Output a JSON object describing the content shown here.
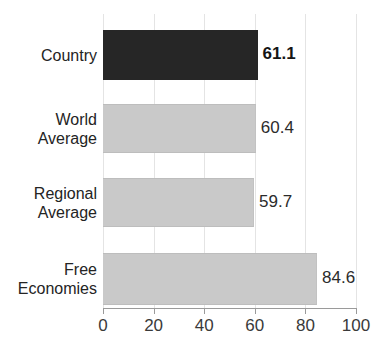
{
  "chart_data": {
    "type": "bar",
    "orientation": "horizontal",
    "title": "Country vs. Comparators",
    "title_visible": false,
    "categories": [
      "Country",
      "World Average",
      "Regional Average",
      "Free Economies"
    ],
    "category_label_lines": [
      [
        "Country"
      ],
      [
        "World",
        "Average"
      ],
      [
        "Regional",
        "Average"
      ],
      [
        "Free",
        "Economies"
      ]
    ],
    "values": [
      61.1,
      60.4,
      59.7,
      84.6
    ],
    "value_labels": [
      "61.1",
      "60.4",
      "59.7",
      "84.6"
    ],
    "bar_styles": [
      "dark",
      "light",
      "light",
      "light"
    ],
    "value_label_emphasis": [
      true,
      false,
      false,
      false
    ],
    "xlabel": "",
    "ylabel": "",
    "xlim": [
      0,
      100
    ],
    "xticks": [
      0,
      20,
      40,
      60,
      80,
      100
    ],
    "xtick_labels": [
      "0",
      "20",
      "40",
      "60",
      "80",
      "100"
    ],
    "grid": true,
    "grid_axis": "x",
    "legend": false,
    "colors": {
      "bar_dark": "#262626",
      "bar_light": "#c9c9c9",
      "bar_light_edge": "#bdbdbd",
      "gridline": "#e4e4e4",
      "axis": "#9a9a9a",
      "text": "#242424",
      "background": "#ffffff"
    }
  }
}
